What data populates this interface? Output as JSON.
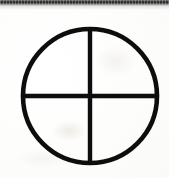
{
  "canvas": {
    "width": 169,
    "height": 178,
    "background_color": "#fcfcfb",
    "caption": "Quartered circle symbol"
  },
  "scan_artifact": {
    "name": "top-scan-band",
    "description": "dark horizontal scanner band across top edge",
    "color": "#2b2b2b",
    "height_px": 5
  },
  "symbol": {
    "name": "quartered-circle",
    "label": "Earth symbol (circle with inscribed cross)",
    "stroke_color": "#0d0d0d",
    "fill_color": "none",
    "stroke_width": 4.6,
    "center_x": 90,
    "center_y": 96,
    "radius": 67,
    "parts": [
      {
        "name": "circle-outline",
        "type": "circle",
        "cx": 90,
        "cy": 96,
        "r": 67,
        "stroke_width": 4.6
      },
      {
        "name": "vertical-line",
        "type": "line",
        "x1": 90,
        "y1": 29,
        "x2": 90,
        "y2": 163,
        "stroke_width": 4.4
      },
      {
        "name": "horizontal-line",
        "type": "line",
        "x1": 23,
        "y1": 96,
        "x2": 157,
        "y2": 96,
        "stroke_width": 4.4
      }
    ]
  }
}
